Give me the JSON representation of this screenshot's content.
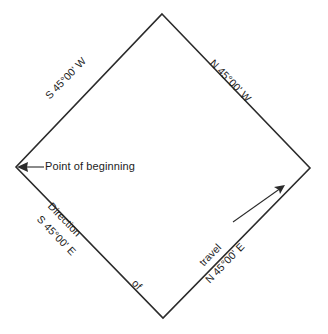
{
  "diagram": {
    "shape": "diamond",
    "line_color": "#2b2b2b",
    "background_color": "#ffffff",
    "vertices": {
      "north": {
        "x": 162,
        "y": 14
      },
      "east": {
        "x": 310,
        "y": 168
      },
      "south": {
        "x": 163,
        "y": 318
      },
      "west": {
        "x": 16,
        "y": 167
      }
    },
    "edges": [
      {
        "id": "northwest",
        "from": "west",
        "to": "north",
        "bearing_label": "S 45°00' W"
      },
      {
        "id": "northeast",
        "from": "north",
        "to": "east",
        "bearing_label": "N 45°00' W"
      },
      {
        "id": "southeast",
        "from": "south",
        "to": "east",
        "bearing_label": "N 45°00' E"
      },
      {
        "id": "southwest",
        "from": "west",
        "to": "south",
        "bearing_label": "S 45°00' E"
      }
    ],
    "callout": {
      "text": "Point of beginning",
      "points_to": "west",
      "arrow": "left-arrow-icon"
    },
    "travel_annotation": {
      "word_direction": "Direction",
      "word_of": "of",
      "word_travel": "travel",
      "arrow": "travel-direction-arrow-icon",
      "arrow_heading": "northeast"
    }
  }
}
